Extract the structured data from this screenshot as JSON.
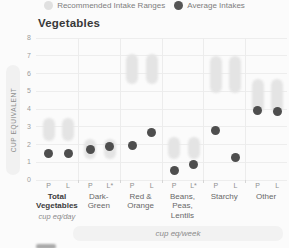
{
  "title": "Vegetables",
  "legend": {
    "items": [
      {
        "label": "Recommended Intake Ranges",
        "color": "#e0e0e0"
      },
      {
        "label": "Average Intakes",
        "color": "#555555"
      }
    ]
  },
  "colors": {
    "range_fill": "#e4e4e4",
    "average_fill": "#4e4e4e",
    "grid": "#ededed",
    "background": "#fbfbfb"
  },
  "chart_data": {
    "type": "range-dot",
    "title": "Vegetables",
    "ylabel": "CUP EQUIVALENT",
    "ylim": [
      0,
      8
    ],
    "yticks": [
      0,
      1,
      2,
      3,
      4,
      5,
      6,
      7,
      8
    ],
    "grid": true,
    "legend_position": "top",
    "unit_day": "cup eq/day",
    "unit_week": "cup eq/week",
    "groups": [
      {
        "name": "Total Vegetables",
        "name_lines": [
          "Total",
          "Vegetables"
        ],
        "bold": true,
        "unit": "cup eq/day",
        "columns": [
          {
            "label": "P",
            "range": [
              2.5,
              3.2
            ],
            "average": 1.5
          },
          {
            "label": "L",
            "range": [
              2.5,
              3.2
            ],
            "average": 1.5
          }
        ]
      },
      {
        "name": "Dark-Green",
        "name_lines": [
          "Dark-",
          "Green"
        ],
        "bold": false,
        "unit": "cup eq/week",
        "columns": [
          {
            "label": "P",
            "range": [
              1.5,
              2.0
            ],
            "average": 1.7
          },
          {
            "label": "L*",
            "range": [
              1.5,
              2.0
            ],
            "average": 1.9
          }
        ]
      },
      {
        "name": "Red & Orange",
        "name_lines": [
          "Red &",
          "Orange"
        ],
        "bold": false,
        "unit": "cup eq/week",
        "columns": [
          {
            "label": "P",
            "range": [
              5.7,
              6.8
            ],
            "average": 1.95
          },
          {
            "label": "L",
            "range": [
              5.7,
              6.8
            ],
            "average": 2.65
          }
        ]
      },
      {
        "name": "Beans, Peas, Lentils",
        "name_lines": [
          "Beans,",
          "Peas,",
          "Lentils"
        ],
        "bold": false,
        "unit": "cup eq/week",
        "columns": [
          {
            "label": "P",
            "range": [
              1.5,
              2.1
            ],
            "average": 0.55
          },
          {
            "label": "L*",
            "range": [
              1.5,
              2.1
            ],
            "average": 0.9
          }
        ]
      },
      {
        "name": "Starchy",
        "name_lines": [
          "Starchy"
        ],
        "bold": false,
        "unit": "cup eq/week",
        "columns": [
          {
            "label": "P",
            "range": [
              5.2,
              6.7
            ],
            "average": 2.8
          },
          {
            "label": "L",
            "range": [
              5.2,
              6.7
            ],
            "average": 1.25
          }
        ]
      },
      {
        "name": "Other",
        "name_lines": [
          "Other"
        ],
        "bold": false,
        "unit": "cup eq/week",
        "columns": [
          {
            "label": "P",
            "range": [
              4.1,
              5.4
            ],
            "average": 3.9
          },
          {
            "label": "L",
            "range": [
              4.1,
              5.4
            ],
            "average": 3.85
          }
        ]
      }
    ]
  }
}
